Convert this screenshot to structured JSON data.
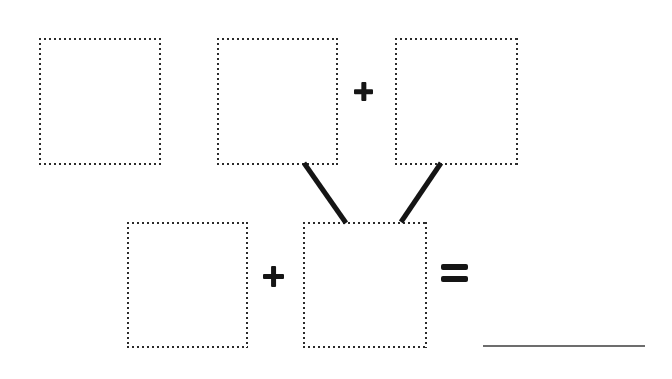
{
  "canvas": {
    "width": 672,
    "height": 379,
    "background": "#ffffff",
    "ink_color": "#151515",
    "dotted_color": "#2b2b2b",
    "rule_color": "#6d6d6d",
    "description": "Blank fill-in worksheet: three empty dotted boxes on the top row joined by a plus sign, two diagonal connector strokes leading down to the bottom row of two empty dotted boxes joined by a plus sign, an equals sign and a blank answer rule."
  },
  "boxes": [
    {
      "id": "top-left",
      "label": "blank-box-1",
      "x": 39,
      "y": 38,
      "w": 122,
      "h": 127
    },
    {
      "id": "top-middle",
      "label": "blank-box-2",
      "x": 217,
      "y": 38,
      "w": 121,
      "h": 127
    },
    {
      "id": "top-right",
      "label": "blank-box-3",
      "x": 395,
      "y": 38,
      "w": 123,
      "h": 127
    },
    {
      "id": "bottom-left",
      "label": "blank-box-4",
      "x": 127,
      "y": 222,
      "w": 121,
      "h": 126
    },
    {
      "id": "bottom-middle",
      "label": "blank-box-5",
      "x": 303,
      "y": 222,
      "w": 124,
      "h": 126
    }
  ],
  "operators": [
    {
      "id": "plus-top",
      "symbol": "+",
      "name": "plus",
      "x": 354,
      "y": 82,
      "size": 19
    },
    {
      "id": "plus-bottom",
      "symbol": "+",
      "name": "plus",
      "x": 263,
      "y": 266,
      "size": 21
    },
    {
      "id": "equals",
      "symbol": "=",
      "name": "equals",
      "x": 441,
      "y": 264,
      "w": 27,
      "h": 18
    }
  ],
  "connectors": [
    {
      "id": "left-diagonal",
      "x1": 304,
      "y1": 163,
      "x2": 346,
      "y2": 223,
      "width": 5,
      "color": "#151515"
    },
    {
      "id": "right-diagonal",
      "x1": 441,
      "y1": 163,
      "x2": 401,
      "y2": 222,
      "width": 5,
      "color": "#151515"
    }
  ],
  "answer_rule": {
    "id": "answer-line",
    "x": 483,
    "y": 345,
    "w": 162,
    "color": "#6d6d6d"
  }
}
